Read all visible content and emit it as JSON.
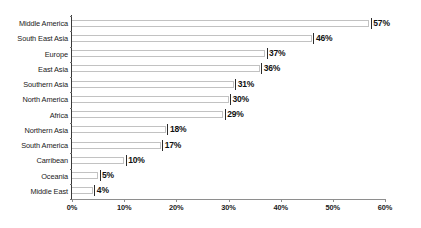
{
  "chart_data": {
    "type": "bar",
    "orientation": "horizontal",
    "title": "",
    "subtitle": "",
    "xlabel": "",
    "ylabel": "",
    "xlim": [
      0,
      60
    ],
    "grid": false,
    "legend": null,
    "value_suffix": "%",
    "categories": [
      "Middle America",
      "South East Asia",
      "Europe",
      "East Asia",
      "Southern Asia",
      "North America",
      "Africa",
      "Northern Asia",
      "South America",
      "Carribean",
      "Oceania",
      "Middle East"
    ],
    "values": [
      57,
      46,
      37,
      36,
      31,
      30,
      29,
      18,
      17,
      10,
      5,
      4
    ],
    "data_labels": [
      "57%",
      "46%",
      "37%",
      "36%",
      "31%",
      "30%",
      "29%",
      "18%",
      "17%",
      "10%",
      "5%",
      "4%"
    ],
    "xticks": [
      0,
      10,
      20,
      30,
      40,
      50,
      60
    ],
    "xtick_labels": [
      "0%",
      "10%",
      "20%",
      "30%",
      "40%",
      "50%",
      "60%"
    ],
    "colors": {
      "bar_fill": "#ffffff",
      "bar_outline": "#c2c2c2",
      "bar_cap": "#2b2b2b",
      "axis": "#3a3a3a",
      "text": "#1a1a1a",
      "background": "#ffffff"
    }
  }
}
